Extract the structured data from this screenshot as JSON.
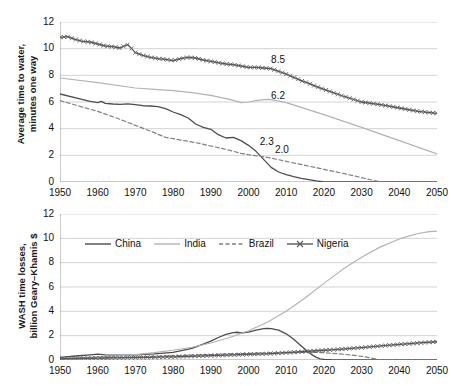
{
  "chart_data": [
    {
      "id": "top",
      "type": "line",
      "title": "",
      "xlabel": "",
      "ylabel": "Average time to water,\nminutes one way",
      "xlim": [
        1950,
        2050
      ],
      "ylim": [
        0,
        12
      ],
      "yticks": [
        0,
        2,
        4,
        6,
        8,
        10,
        12
      ],
      "xticks": [
        1950,
        1960,
        1970,
        1980,
        1990,
        2000,
        2010,
        2020,
        2030,
        2040,
        2050
      ],
      "grid": "horizontal",
      "minor_x_ticks": true,
      "legend": "none",
      "annotations": [
        {
          "text": "8.5",
          "x": 2006,
          "y": 9.1
        },
        {
          "text": "6.2",
          "x": 2006,
          "y": 6.4
        },
        {
          "text": "2.3",
          "x": 2003,
          "y": 2.95
        },
        {
          "text": "2.0",
          "x": 2007,
          "y": 2.35
        }
      ],
      "series": [
        {
          "name": "China",
          "style": "solid-dark",
          "color": "#4d4d4d",
          "x": [
            1950,
            1955,
            1958,
            1960,
            1961,
            1962,
            1964,
            1966,
            1968,
            1970,
            1972,
            1974,
            1976,
            1978,
            1980,
            1982,
            1984,
            1986,
            1988,
            1990,
            1992,
            1994,
            1996,
            1998,
            2000,
            2002,
            2004,
            2006,
            2008,
            2010,
            2012,
            2014,
            2016,
            2018,
            2020,
            2050
          ],
          "y": [
            6.6,
            6.25,
            6.05,
            5.95,
            6.05,
            5.9,
            5.85,
            5.82,
            5.86,
            5.8,
            5.72,
            5.7,
            5.65,
            5.5,
            5.25,
            5.05,
            4.8,
            4.35,
            4.1,
            3.95,
            3.55,
            3.3,
            3.35,
            3.1,
            2.75,
            2.3,
            1.7,
            1.1,
            0.75,
            0.55,
            0.4,
            0.28,
            0.18,
            0.08,
            0.0,
            0.0
          ]
        },
        {
          "name": "India",
          "style": "solid-light",
          "color": "#b3b3b3",
          "x": [
            1950,
            1960,
            1970,
            1975,
            1980,
            1985,
            1990,
            1995,
            1998,
            2000,
            2002,
            2004,
            2005,
            2006,
            2010,
            2020,
            2030,
            2040,
            2050
          ],
          "y": [
            7.8,
            7.45,
            7.05,
            6.95,
            6.85,
            6.7,
            6.5,
            6.2,
            5.95,
            6.0,
            6.1,
            6.18,
            6.2,
            6.18,
            5.95,
            5.05,
            4.1,
            3.1,
            2.1
          ]
        },
        {
          "name": "Brazil",
          "style": "dashed",
          "color": "#808080",
          "x": [
            1950,
            1955,
            1960,
            1965,
            1970,
            1975,
            1978,
            1980,
            1983,
            1986,
            1990,
            1994,
            1998,
            2000,
            2005,
            2010,
            2015,
            2020,
            2025,
            2030,
            2035,
            2050
          ],
          "y": [
            6.1,
            5.7,
            5.3,
            4.8,
            4.25,
            3.7,
            3.35,
            3.25,
            3.1,
            2.95,
            2.7,
            2.45,
            2.15,
            2.05,
            1.85,
            1.55,
            1.25,
            0.95,
            0.65,
            0.33,
            0.0,
            0.0
          ]
        },
        {
          "name": "Nigeria",
          "style": "x-marker",
          "color": "#595959",
          "x": [
            1950,
            1952,
            1954,
            1956,
            1958,
            1960,
            1962,
            1964,
            1966,
            1967,
            1968,
            1969,
            1970,
            1972,
            1974,
            1976,
            1978,
            1980,
            1982,
            1984,
            1986,
            1988,
            1990,
            1992,
            1994,
            1996,
            1998,
            2000,
            2002,
            2004,
            2006,
            2008,
            2010,
            2012,
            2014,
            2016,
            2018,
            2020,
            2025,
            2030,
            2035,
            2040,
            2045,
            2050
          ],
          "y": [
            10.85,
            10.9,
            10.7,
            10.55,
            10.5,
            10.35,
            10.2,
            10.15,
            10.05,
            10.2,
            10.3,
            10.0,
            9.7,
            9.5,
            9.35,
            9.25,
            9.2,
            9.1,
            9.25,
            9.35,
            9.3,
            9.15,
            9.05,
            8.95,
            8.85,
            8.8,
            8.7,
            8.6,
            8.6,
            8.55,
            8.5,
            8.3,
            8.1,
            7.85,
            7.6,
            7.4,
            7.15,
            6.95,
            6.45,
            6.0,
            5.8,
            5.55,
            5.3,
            5.15
          ]
        }
      ]
    },
    {
      "id": "bottom",
      "type": "line",
      "title": "",
      "xlabel": "",
      "ylabel": "WASH time losses,\nbillion Geary–Khamis $",
      "xlim": [
        1950,
        2050
      ],
      "ylim": [
        0,
        12
      ],
      "yticks": [
        0,
        2,
        4,
        6,
        8,
        10,
        12
      ],
      "xticks": [
        1950,
        1960,
        1970,
        1980,
        1990,
        2000,
        2010,
        2020,
        2030,
        2040,
        2050
      ],
      "grid": "horizontal",
      "minor_x_ticks": true,
      "legend": "inside-top",
      "legend_entries": [
        "China",
        "India",
        "Brazil",
        "Nigeria"
      ],
      "series": [
        {
          "name": "China",
          "style": "solid-dark",
          "color": "#4d4d4d",
          "x": [
            1950,
            1955,
            1958,
            1960,
            1962,
            1965,
            1970,
            1975,
            1980,
            1985,
            1988,
            1990,
            1992,
            1994,
            1996,
            1997,
            1998,
            2000,
            2002,
            2004,
            2005,
            2006,
            2008,
            2010,
            2012,
            2014,
            2016,
            2017,
            2018,
            2019,
            2020,
            2022,
            2025,
            2030,
            2040,
            2050
          ],
          "y": [
            0.22,
            0.35,
            0.42,
            0.48,
            0.42,
            0.4,
            0.42,
            0.5,
            0.62,
            0.95,
            1.3,
            1.55,
            1.85,
            2.1,
            2.25,
            2.28,
            2.22,
            2.3,
            2.45,
            2.58,
            2.6,
            2.58,
            2.45,
            2.15,
            1.7,
            1.15,
            0.62,
            0.4,
            0.22,
            0.1,
            0.05,
            0.02,
            0.0,
            0.0,
            0.0,
            0.0
          ]
        },
        {
          "name": "India",
          "style": "solid-light",
          "color": "#b3b3b3",
          "x": [
            1950,
            1955,
            1960,
            1965,
            1970,
            1975,
            1980,
            1985,
            1990,
            1995,
            2000,
            2005,
            2010,
            2015,
            2020,
            2025,
            2030,
            2035,
            2040,
            2045,
            2048,
            2050
          ],
          "y": [
            0.12,
            0.18,
            0.25,
            0.34,
            0.45,
            0.6,
            0.8,
            1.05,
            1.4,
            1.85,
            2.4,
            3.1,
            4.0,
            5.1,
            6.3,
            7.45,
            8.45,
            9.3,
            9.95,
            10.4,
            10.55,
            10.6
          ]
        },
        {
          "name": "Brazil",
          "style": "dashed",
          "color": "#808080",
          "x": [
            1950,
            1960,
            1970,
            1980,
            1985,
            1990,
            1995,
            2000,
            2005,
            2010,
            2015,
            2018,
            2020,
            2022,
            2025,
            2028,
            2030,
            2032,
            2034,
            2035,
            2040,
            2050
          ],
          "y": [
            0.1,
            0.18,
            0.25,
            0.35,
            0.4,
            0.45,
            0.5,
            0.55,
            0.58,
            0.6,
            0.62,
            0.62,
            0.6,
            0.55,
            0.48,
            0.38,
            0.3,
            0.2,
            0.08,
            0.02,
            0.0,
            0.0
          ]
        },
        {
          "name": "Nigeria",
          "style": "x-marker",
          "color": "#595959",
          "x": [
            1950,
            1952,
            1954,
            1956,
            1958,
            1960,
            1962,
            1964,
            1966,
            1968,
            1970,
            1972,
            1974,
            1976,
            1978,
            1980,
            1982,
            1984,
            1986,
            1988,
            1990,
            1992,
            1994,
            1996,
            1998,
            2000,
            2002,
            2004,
            2006,
            2008,
            2010,
            2012,
            2014,
            2016,
            2018,
            2020,
            2022,
            2025,
            2028,
            2030,
            2033,
            2036,
            2040,
            2043,
            2046,
            2050
          ],
          "y": [
            0.1,
            0.11,
            0.12,
            0.13,
            0.14,
            0.15,
            0.16,
            0.17,
            0.18,
            0.19,
            0.2,
            0.21,
            0.22,
            0.23,
            0.25,
            0.26,
            0.28,
            0.3,
            0.32,
            0.34,
            0.36,
            0.38,
            0.4,
            0.42,
            0.44,
            0.46,
            0.48,
            0.5,
            0.53,
            0.56,
            0.6,
            0.64,
            0.68,
            0.72,
            0.76,
            0.8,
            0.84,
            0.9,
            0.97,
            1.02,
            1.1,
            1.18,
            1.28,
            1.35,
            1.42,
            1.5
          ]
        }
      ]
    }
  ]
}
